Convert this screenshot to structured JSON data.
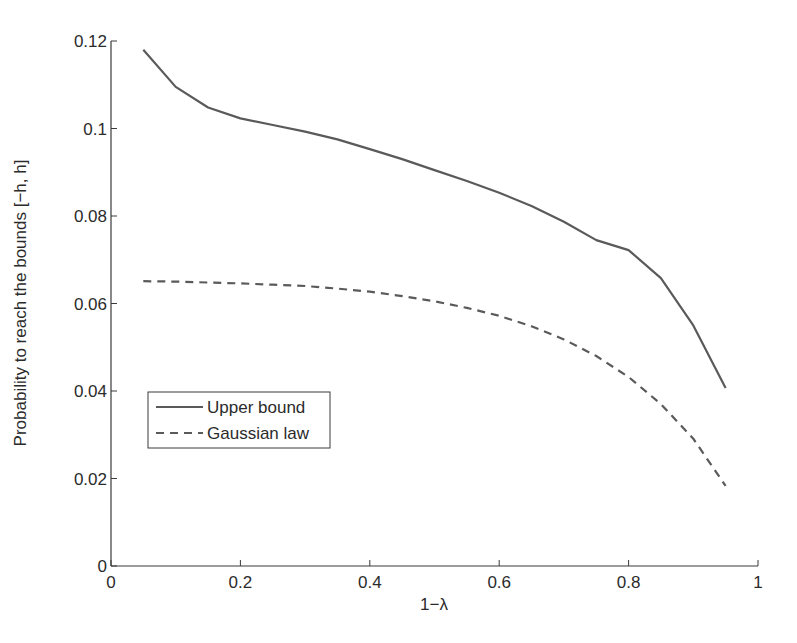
{
  "chart_data": {
    "type": "line",
    "title": "",
    "xlabel": "1−λ",
    "ylabel": "Probability to reach the bounds [−h, h]",
    "xlim": [
      0,
      1
    ],
    "ylim": [
      0,
      0.12
    ],
    "xticks": [
      "0",
      "0.2",
      "0.4",
      "0.6",
      "0.8",
      "1"
    ],
    "yticks": [
      "0",
      "0.02",
      "0.04",
      "0.06",
      "0.08",
      "0.1",
      "0.12"
    ],
    "grid": false,
    "legend_position": "lower left",
    "x": [
      0.05,
      0.1,
      0.15,
      0.2,
      0.25,
      0.3,
      0.35,
      0.4,
      0.45,
      0.5,
      0.55,
      0.6,
      0.65,
      0.7,
      0.75,
      0.8,
      0.85,
      0.9,
      0.95
    ],
    "series": [
      {
        "name": "Upper bound",
        "style": "solid",
        "values": [
          0.118,
          0.1095,
          0.1048,
          0.1023,
          0.1008,
          0.0993,
          0.0975,
          0.0953,
          0.093,
          0.0905,
          0.088,
          0.0853,
          0.0823,
          0.0787,
          0.0745,
          0.0722,
          0.0658,
          0.055,
          0.0407
        ]
      },
      {
        "name": "Gaussian law",
        "style": "dashed",
        "values": [
          0.0651,
          0.065,
          0.0648,
          0.0646,
          0.0643,
          0.064,
          0.0634,
          0.0627,
          0.0617,
          0.0605,
          0.059,
          0.0572,
          0.0548,
          0.0518,
          0.048,
          0.0432,
          0.037,
          0.0291,
          0.0183
        ]
      }
    ]
  },
  "legend": {
    "items": [
      {
        "label": "Upper bound"
      },
      {
        "label": "Gaussian law"
      }
    ]
  },
  "colors": {
    "line": "#5a5a5a",
    "axis": "#3a3a3a",
    "text": "#2b2b2b"
  }
}
